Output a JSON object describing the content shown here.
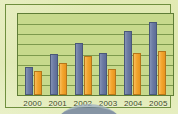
{
  "chart_data": {
    "type": "bar",
    "title": "",
    "xlabel": "",
    "ylabel": "",
    "categories": [
      "2000",
      "2001",
      "2002",
      "2003",
      "2004",
      "2005"
    ],
    "series": [
      {
        "name": "series-blue",
        "color": "#6c7ba4",
        "values": [
          28,
          42,
          53,
          43,
          65,
          74
        ]
      },
      {
        "name": "series-orange",
        "color": "#f3a52e",
        "values": [
          24,
          32,
          40,
          26,
          43,
          45
        ]
      }
    ],
    "ylim": [
      0,
      82
    ],
    "grid": true,
    "gridlines": 7,
    "legend": "none",
    "plot_background": "#c7d98c",
    "frame_color": "#6f8f3e"
  },
  "axis": {
    "ticks": [
      "2000",
      "2001",
      "2002",
      "2003",
      "2004",
      "2005"
    ]
  }
}
